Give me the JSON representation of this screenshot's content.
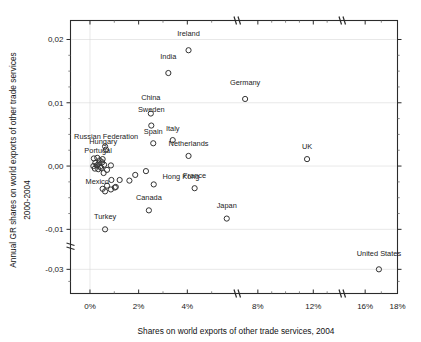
{
  "chart_data": {
    "type": "scatter",
    "title": "",
    "xlabel": "Shares on world exports of  other trade services, 2004",
    "ylabel_line1": "Annual GR shares on world exports of other trade services",
    "ylabel_line2": "2000-2004",
    "xlim": [
      -0.8,
      18
    ],
    "ylim": [
      -0.035,
      0.023
    ],
    "x_tick_labels": [
      "0%",
      "2%",
      "4%",
      "8%",
      "12%",
      "16%",
      "18%"
    ],
    "x_tick_values": [
      0,
      2,
      4,
      8,
      12,
      16,
      18
    ],
    "y_tick_labels": [
      "0,02",
      "0,01",
      "0,00",
      "-0,01",
      "-0,03"
    ],
    "y_tick_values": [
      0.02,
      0.01,
      0.0,
      -0.01,
      -0.03
    ],
    "axis_breaks": {
      "x_axis": true,
      "y_axis": true
    },
    "grid": "horizontal-faint",
    "legend": "none",
    "marker": "open-circle",
    "points": [
      {
        "label": "Ireland",
        "x": 4.05,
        "y": 0.0183,
        "lx": 4.05,
        "ly": 0.0205,
        "anchor": "middle"
      },
      {
        "label": "India",
        "x": 3.22,
        "y": 0.0147,
        "lx": 3.22,
        "ly": 0.0169,
        "anchor": "middle"
      },
      {
        "label": "Germany",
        "x": 7.08,
        "y": 0.0106,
        "lx": 7.08,
        "ly": 0.0128,
        "anchor": "middle"
      },
      {
        "label": "China",
        "x": 2.5,
        "y": 0.0083,
        "lx": 2.5,
        "ly": 0.0105,
        "anchor": "middle"
      },
      {
        "label": "Sweden",
        "x": 2.52,
        "y": 0.0064,
        "lx": 2.52,
        "ly": 0.0086,
        "anchor": "middle"
      },
      {
        "label": "Spain",
        "x": 2.6,
        "y": 0.0036,
        "lx": 2.6,
        "ly": 0.005,
        "anchor": "middle"
      },
      {
        "label": "Italy",
        "x": 3.4,
        "y": 0.0041,
        "lx": 3.4,
        "ly": 0.0055,
        "anchor": "middle"
      },
      {
        "label": "Russian Federation",
        "x": 0.62,
        "y": 0.0031,
        "lx": 1.98,
        "ly": 0.0043,
        "anchor": "end"
      },
      {
        "label": "Hungary",
        "x": 0.66,
        "y": 0.0026,
        "lx": 1.12,
        "ly": 0.0035,
        "anchor": "end"
      },
      {
        "label": "Netherlands",
        "x": 4.05,
        "y": 0.0016,
        "lx": 4.05,
        "ly": 0.0031,
        "anchor": "middle"
      },
      {
        "label": "Portugal",
        "x": 0.52,
        "y": 0.0011,
        "lx": 0.9,
        "ly": 0.0021,
        "anchor": "end"
      },
      {
        "label": "UK",
        "x": 11.55,
        "y": 0.0011,
        "lx": 11.55,
        "ly": 0.0027,
        "anchor": "middle"
      },
      {
        "label": "Hong Kong",
        "x": 2.62,
        "y": -0.0029,
        "lx": 2.98,
        "ly": -0.002,
        "anchor": "start"
      },
      {
        "label": "France",
        "x": 4.3,
        "y": -0.0035,
        "lx": 4.3,
        "ly": -0.0019,
        "anchor": "middle"
      },
      {
        "label": "Mexico",
        "x": 0.52,
        "y": -0.0036,
        "lx": 0.78,
        "ly": -0.0029,
        "anchor": "end"
      },
      {
        "label": "Canada",
        "x": 2.42,
        "y": -0.007,
        "lx": 2.42,
        "ly": -0.0054,
        "anchor": "middle"
      },
      {
        "label": "Japan",
        "x": 5.62,
        "y": -0.0083,
        "lx": 5.62,
        "ly": -0.0066,
        "anchor": "middle"
      },
      {
        "label": "Turkey",
        "x": 0.62,
        "y": -0.01,
        "lx": 0.62,
        "ly": -0.0084,
        "anchor": "middle"
      },
      {
        "label": "United States",
        "x": 16.85,
        "y": -0.03,
        "lx": 16.85,
        "ly": -0.0272,
        "anchor": "middle"
      }
    ],
    "unlabeled_points": [
      {
        "x": 0.16,
        "y": 0.0012
      },
      {
        "x": 0.3,
        "y": 0.0013
      },
      {
        "x": 0.4,
        "y": 0.0009
      },
      {
        "x": 0.22,
        "y": 0.0005
      },
      {
        "x": 0.36,
        "y": 0.0004
      },
      {
        "x": 0.5,
        "y": 0.0006
      },
      {
        "x": 0.14,
        "y": 0.0
      },
      {
        "x": 0.28,
        "y": 0.0001
      },
      {
        "x": 0.42,
        "y": -0.0001
      },
      {
        "x": 0.2,
        "y": -0.0004
      },
      {
        "x": 0.34,
        "y": -0.0005
      },
      {
        "x": 0.46,
        "y": -0.0003
      },
      {
        "x": 0.58,
        "y": 0.0002
      },
      {
        "x": 0.7,
        "y": -0.0006
      },
      {
        "x": 0.86,
        "y": 0.0001
      },
      {
        "x": 0.56,
        "y": -0.0011
      },
      {
        "x": 0.88,
        "y": -0.0022
      },
      {
        "x": 0.7,
        "y": -0.0031
      },
      {
        "x": 0.62,
        "y": -0.004
      },
      {
        "x": 0.86,
        "y": -0.0037
      },
      {
        "x": 1.22,
        "y": -0.0022
      },
      {
        "x": 1.06,
        "y": -0.0033
      },
      {
        "x": 1.62,
        "y": -0.0023
      },
      {
        "x": 1.86,
        "y": -0.0014
      },
      {
        "x": 2.3,
        "y": -0.0008
      },
      {
        "x": 1.02,
        "y": -0.0034
      }
    ]
  }
}
